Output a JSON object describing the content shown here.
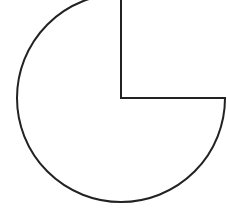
{
  "diagram": {
    "type": "three-quarter-circle",
    "center": [
      121,
      98
    ],
    "radius": 104,
    "missing_quadrant": "top-right",
    "stroke_color": "#222222",
    "fill_color": "#ffffff",
    "stroke_width": 2
  }
}
